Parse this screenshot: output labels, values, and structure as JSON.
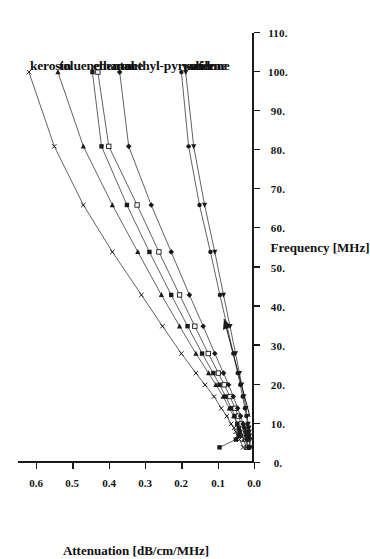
{
  "figure": {
    "orientation": "rotated-90-clockwise",
    "background": "#ffffff",
    "ink_color": "#1a1a1a"
  },
  "chart_data": {
    "type": "line",
    "title": "",
    "subtitle": "",
    "xlabel": "Frequency [MHz]",
    "ylabel": "Attenuation [dB/cm/MHz]",
    "xlim": [
      0,
      110
    ],
    "ylim": [
      0.0,
      0.65
    ],
    "xticks": [
      "0.",
      "10.",
      "20.",
      "30.",
      "40.",
      "50.",
      "60.",
      "70.",
      "80.",
      "90.",
      "100.",
      "110."
    ],
    "xtick_values": [
      0,
      10,
      20,
      30,
      40,
      50,
      60,
      70,
      80,
      90,
      100,
      110
    ],
    "yticks": [
      "0.0",
      "0.1",
      "0.2",
      "0.3",
      "0.4",
      "0.5",
      "0.6"
    ],
    "ytick_values": [
      0.0,
      0.1,
      0.2,
      0.3,
      0.4,
      0.5,
      0.6
    ],
    "grid": false,
    "legend_position": "inline-right-of-curve-ends",
    "annotations": [
      {
        "name": "origin-arrow",
        "text": "",
        "points_to": "low-frequency data cluster"
      }
    ],
    "series": [
      {
        "name": "kerosin",
        "label": "kerosin",
        "marker": "x",
        "color": "#3a3a3a",
        "x": [
          4,
          6,
          7,
          8,
          9,
          10,
          12,
          14,
          17,
          20,
          23,
          28,
          35,
          43,
          54,
          66,
          81,
          100
        ],
        "y": [
          0.03,
          0.04,
          0.045,
          0.05,
          0.055,
          0.063,
          0.075,
          0.09,
          0.11,
          0.135,
          0.16,
          0.2,
          0.252,
          0.31,
          0.39,
          0.47,
          0.55,
          0.62
        ]
      },
      {
        "name": "toluene",
        "label": "toluene",
        "marker": "triangle-right",
        "color": "#3a3a3a",
        "x": [
          4,
          6,
          7,
          8,
          9,
          10,
          12,
          14,
          17,
          20,
          23,
          28,
          35,
          43,
          54,
          66,
          81,
          100
        ],
        "y": [
          0.022,
          0.028,
          0.032,
          0.036,
          0.04,
          0.046,
          0.056,
          0.068,
          0.085,
          0.105,
          0.125,
          0.16,
          0.205,
          0.255,
          0.32,
          0.39,
          0.47,
          0.54
        ]
      },
      {
        "name": "ethanol",
        "label": "ethanol",
        "marker": "square-filled",
        "color": "#3a3a3a",
        "x": [
          4,
          6,
          7,
          8,
          9,
          10,
          12,
          14,
          17,
          20,
          23,
          28,
          35,
          43,
          54,
          66,
          81,
          100
        ],
        "y": [
          0.095,
          0.05,
          0.042,
          0.04,
          0.042,
          0.046,
          0.053,
          0.062,
          0.078,
          0.095,
          0.112,
          0.143,
          0.183,
          0.228,
          0.288,
          0.35,
          0.42,
          0.445
        ]
      },
      {
        "name": "heptane",
        "label": "hentane",
        "marker": "square-open",
        "color": "#3a3a3a",
        "x": [
          4,
          6,
          7,
          8,
          9,
          10,
          12,
          14,
          17,
          20,
          23,
          28,
          35,
          43,
          54,
          66,
          81,
          100
        ],
        "y": [
          0.018,
          0.022,
          0.025,
          0.028,
          0.031,
          0.035,
          0.043,
          0.052,
          0.066,
          0.082,
          0.098,
          0.126,
          0.163,
          0.205,
          0.262,
          0.322,
          0.4,
          0.43
        ]
      },
      {
        "name": "methyl-pyrrolidone",
        "label": "methyl-pyrrolidone",
        "marker": "diamond-filled",
        "color": "#3a3a3a",
        "x": [
          4,
          6,
          7,
          8,
          9,
          10,
          12,
          14,
          17,
          20,
          23,
          28,
          35,
          43,
          54,
          66,
          81,
          100
        ],
        "y": [
          0.016,
          0.02,
          0.022,
          0.024,
          0.027,
          0.03,
          0.037,
          0.045,
          0.057,
          0.07,
          0.084,
          0.108,
          0.14,
          0.178,
          0.228,
          0.283,
          0.345,
          0.37
        ]
      },
      {
        "name": "water",
        "label": "water",
        "marker": "circle-filled",
        "color": "#3a3a3a",
        "x": [
          4,
          6,
          7,
          8,
          9,
          10,
          12,
          14,
          17,
          20,
          23,
          28,
          35,
          43,
          54,
          66,
          81,
          100
        ],
        "y": [
          0.012,
          0.013,
          0.014,
          0.015,
          0.016,
          0.018,
          0.021,
          0.025,
          0.031,
          0.038,
          0.045,
          0.057,
          0.074,
          0.094,
          0.12,
          0.15,
          0.18,
          0.2
        ]
      },
      {
        "name": "anilene",
        "label": "anilene",
        "marker": "triangle-left",
        "color": "#3a3a3a",
        "x": [
          4,
          6,
          7,
          8,
          9,
          10,
          12,
          14,
          17,
          20,
          23,
          28,
          35,
          43,
          54,
          66,
          81,
          100
        ],
        "y": [
          0.01,
          0.011,
          0.012,
          0.013,
          0.014,
          0.016,
          0.019,
          0.022,
          0.028,
          0.034,
          0.04,
          0.051,
          0.066,
          0.084,
          0.108,
          0.136,
          0.166,
          0.188
        ]
      }
    ]
  }
}
